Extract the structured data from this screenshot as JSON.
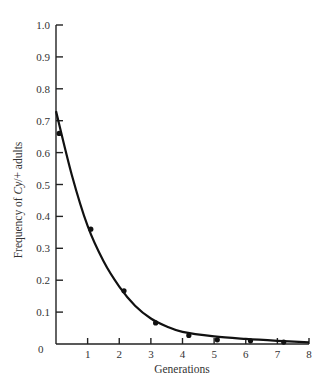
{
  "chart_data": {
    "type": "scatter",
    "title": "",
    "xlabel": "Generations",
    "ylabel": "Frequency of Cy/+ adults",
    "ylabel_parts": {
      "prefix": "Frequency of ",
      "italic": "Cy",
      "suffix": "/+ adults"
    },
    "xlim": [
      0,
      8
    ],
    "ylim": [
      0,
      1.0
    ],
    "x_ticks": [
      1,
      2,
      3,
      4,
      5,
      6,
      7,
      8
    ],
    "x_tick_labels": [
      "1",
      "2",
      "3",
      "4",
      "5",
      "6",
      "7",
      "8"
    ],
    "y_ticks": [
      0.1,
      0.2,
      0.3,
      0.4,
      0.5,
      0.6,
      0.7,
      0.8,
      0.9,
      1.0
    ],
    "y_tick_labels": [
      "0.1",
      "0.2",
      "0.3",
      "0.4",
      "0.5",
      "0.6",
      "0.7",
      "0.8",
      "0.9",
      "1.0"
    ],
    "origin_label": "0",
    "grid": false,
    "legend": null,
    "series": [
      {
        "name": "Observed",
        "kind": "points",
        "x": [
          0.1,
          1.1,
          2.15,
          3.15,
          4.2,
          5.1,
          6.15,
          7.2
        ],
        "y": [
          0.66,
          0.36,
          0.167,
          0.066,
          0.027,
          0.013,
          0.01,
          0.006
        ]
      },
      {
        "name": "Fitted curve",
        "kind": "line",
        "x": [
          0,
          0.5,
          1,
          1.5,
          2,
          2.5,
          3,
          3.5,
          4,
          5,
          6,
          7,
          8
        ],
        "y": [
          0.73,
          0.53,
          0.37,
          0.26,
          0.18,
          0.12,
          0.08,
          0.055,
          0.038,
          0.024,
          0.016,
          0.01,
          0.005
        ]
      }
    ]
  }
}
